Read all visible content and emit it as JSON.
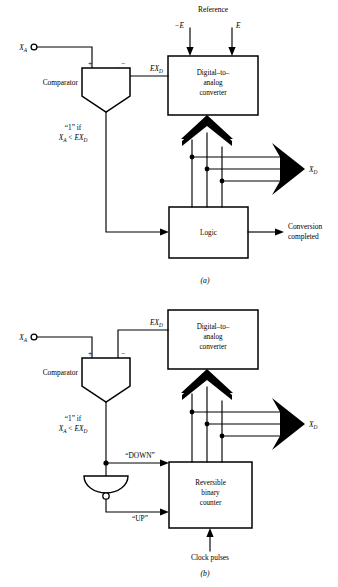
{
  "figure": {
    "panels": [
      {
        "tag": "(a)",
        "name": "successive-approximation-adc",
        "reference_label": "Reference",
        "ref_neg": "−E",
        "ref_pos": "E",
        "input_label": "X",
        "input_sub": "A",
        "feedback_label": "EX",
        "feedback_sub": "D",
        "comparator_label": "Comparator",
        "comparator_plus": "+",
        "comparator_minus": "−",
        "comparator_note_line1": "“1” if",
        "comparator_note_line2_a": "X",
        "comparator_note_line2_a_sub": "A",
        "comparator_note_line2_op": " < ",
        "comparator_note_line2_b": "EX",
        "comparator_note_line2_b_sub": "D",
        "dac_line1": "Digital–to–",
        "dac_line2": "analog",
        "dac_line3": "converter",
        "logic_label": "Logic",
        "output_bus_label": "X",
        "output_bus_sub": "D",
        "done_line1": "Conversion",
        "done_line2": "completed"
      },
      {
        "tag": "(b)",
        "name": "tracking-servo-adc",
        "input_label": "X",
        "input_sub": "A",
        "feedback_label": "EX",
        "feedback_sub": "D",
        "comparator_label": "Comparator",
        "comparator_plus": "+",
        "comparator_minus": "−",
        "comparator_note_line1": "“1” if",
        "comparator_note_line2_a": "X",
        "comparator_note_line2_a_sub": "A",
        "comparator_note_line2_op": " < ",
        "comparator_note_line2_b": "EX",
        "comparator_note_line2_b_sub": "D",
        "dac_line1": "Digital–to–",
        "dac_line2": "analog",
        "dac_line3": "converter",
        "counter_line1": "Reversible",
        "counter_line2": "binary",
        "counter_line3": "counter",
        "down_label": "“DOWN”",
        "up_label": "“UP”",
        "clock_label": "Clock pulses",
        "output_bus_label": "X",
        "output_bus_sub": "D"
      }
    ]
  },
  "colors": {
    "ink": "#000000",
    "paper": "#ffffff"
  }
}
